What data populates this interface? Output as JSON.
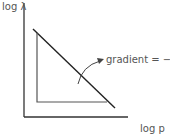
{
  "diagram": {
    "type": "log-log plot sketch",
    "y_axis_label": "log λ",
    "x_axis_label": "log p",
    "annotation": "gradient = −1",
    "colors": {
      "axis": "#333333",
      "line": "#222222",
      "triangle": "#555555",
      "arrow": "#444444",
      "text": "#555555"
    },
    "elements": [
      {
        "name": "y-axis",
        "from": [
          24,
          3
        ],
        "to": [
          24,
          117
        ]
      },
      {
        "name": "x-axis",
        "from": [
          24,
          117
        ],
        "to": [
          128,
          117
        ]
      },
      {
        "name": "line",
        "from": [
          33,
          29
        ],
        "to": [
          115,
          108
        ],
        "gradient": -1
      },
      {
        "name": "triangle-vertical-leg",
        "from": [
          37,
          33
        ],
        "to": [
          37,
          102
        ]
      },
      {
        "name": "triangle-horizontal-leg",
        "from": [
          37,
          102
        ],
        "to": [
          107,
          102
        ]
      },
      {
        "name": "annotation-arrow",
        "from": [
          78,
          84
        ],
        "to": [
          103,
          60
        ]
      }
    ]
  }
}
